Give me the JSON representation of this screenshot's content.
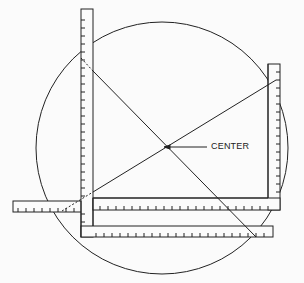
{
  "figure": {
    "labels": {
      "center": "CENTER"
    },
    "colors": {
      "ink": "#222222",
      "paper": "#fbfbfb"
    },
    "circle": {
      "cx": 162,
      "cy": 148,
      "r": 126
    },
    "center_point": {
      "x": 162,
      "y": 148
    },
    "label_position": {
      "x": 213,
      "y": 143
    }
  }
}
